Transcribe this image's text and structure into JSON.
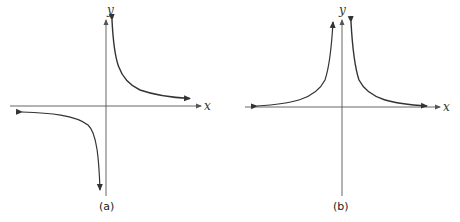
{
  "panels": [
    {
      "id": "a",
      "caption": "(a)",
      "x_label": "x",
      "y_label": "y",
      "description": "Hyperbola-like graph with branches in quadrants I and III (y = 1/x)"
    },
    {
      "id": "b",
      "caption": "(b)",
      "x_label": "x",
      "y_label": "y",
      "description": "Graph with both branches above x-axis (y = 1/x²)"
    }
  ],
  "colors": {
    "axis": "#555555",
    "curve": "#333333",
    "highlight": "#555555"
  }
}
